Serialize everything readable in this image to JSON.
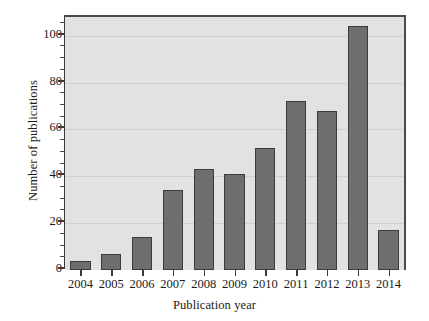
{
  "chart_data": {
    "type": "bar",
    "title": "",
    "xlabel": "Publication year",
    "ylabel": "Number of publications",
    "categories": [
      "2004",
      "2005",
      "2006",
      "2007",
      "2008",
      "2009",
      "2010",
      "2011",
      "2012",
      "2013",
      "2014"
    ],
    "values": [
      4,
      7,
      14,
      34,
      43,
      41,
      52,
      72,
      68,
      104,
      17
    ],
    "ylim": [
      0,
      108
    ],
    "yticks": [
      0,
      20,
      40,
      60,
      80,
      100
    ],
    "ytick_labels": [
      "0",
      "20",
      "40",
      "60",
      "80",
      "100"
    ],
    "grid": "horizontal",
    "legend": "none",
    "bar_color": "#6e6e6e",
    "bar_edge_color": "#3c3c3c",
    "plot_background": "#e2e2e2",
    "figure_background": "#ffffff",
    "axis_color": "#3a3a3a",
    "gridline_color": "#cfcfcf"
  }
}
